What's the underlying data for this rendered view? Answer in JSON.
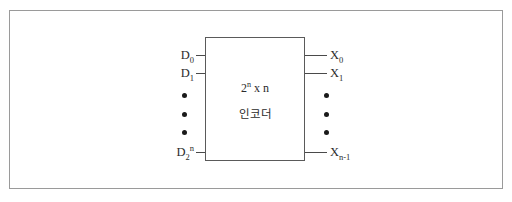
{
  "diagram": {
    "block": {
      "line1_base": "2",
      "line1_exp": "n",
      "line1_rest": " x n",
      "line2": "인코더"
    },
    "inputs": [
      {
        "name": "input-d0",
        "base": "D",
        "sub": "0",
        "sup": "",
        "y": 55
      },
      {
        "name": "input-d1",
        "base": "D",
        "sub": "1",
        "sup": "",
        "y": 73
      },
      {
        "name": "input-d2n",
        "base": "D",
        "sub": "2",
        "sup": "n",
        "y": 152
      }
    ],
    "outputs": [
      {
        "name": "output-x0",
        "base": "X",
        "sub": "0",
        "y": 55
      },
      {
        "name": "output-x1",
        "base": "X",
        "sub": "1",
        "y": 73
      },
      {
        "name": "output-xn1",
        "base": "X",
        "sub": "n-1",
        "y": 152
      }
    ],
    "left_ellipsis_dots": [
      94,
      113,
      131
    ],
    "right_ellipsis_dots": [
      94,
      113,
      131
    ],
    "colors": {
      "frame_border": "#9a9a9a",
      "block_border": "#5a5a5a",
      "wire": "#4a4a4a",
      "text": "#2b2b2b",
      "dot": "#1a1a1a",
      "background": "#ffffff"
    }
  }
}
